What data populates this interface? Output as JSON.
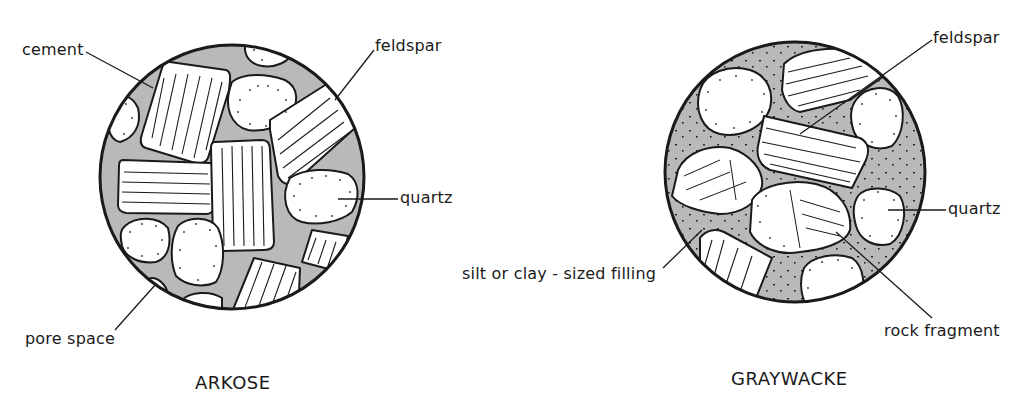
{
  "diagrams": [
    {
      "id": "arkose",
      "title": "ARKOSE",
      "labels": {
        "cement": "cement",
        "feldspar": "feldspar",
        "quartz": "quartz",
        "pore_space": "pore space"
      }
    },
    {
      "id": "graywacke",
      "title": "GRAYWACKE",
      "labels": {
        "feldspar": "feldspar",
        "quartz": "quartz",
        "filling": "silt or clay - sized filling",
        "rock_fragment": "rock fragment"
      }
    }
  ],
  "colors": {
    "background": "#ffffff",
    "matrix_fill": "#b9b9b9",
    "grain_fill": "#ffffff",
    "ink": "#1a1a1a"
  }
}
